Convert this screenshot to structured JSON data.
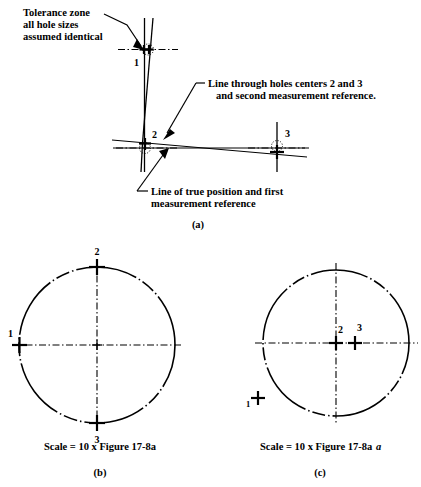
{
  "figure": {
    "title_letters": {
      "a": "(a)",
      "b": "(b)",
      "c": "(c)"
    },
    "panel_a": {
      "annotations": [
        {
          "name": "tolerance-zone-note",
          "lines": [
            "Tolerance zone",
            "all hole sizes",
            "assumed identical"
          ]
        },
        {
          "name": "line-through-holes-note",
          "lines": [
            "Line through holes centers 2 and 3",
            "and second measurement reference."
          ]
        },
        {
          "name": "true-position-note",
          "lines": [
            "Line of true position and first",
            "measurement  reference"
          ]
        }
      ],
      "hole_labels": [
        "1",
        "2",
        "3"
      ]
    },
    "panel_b": {
      "caption": "Scale = 10 x Figure 17-8a",
      "hole_labels": [
        "1",
        "2",
        "3"
      ]
    },
    "panel_c": {
      "caption_main": "Scale = 10 x Figure 17-8a",
      "caption_italic": "a",
      "hole_labels": [
        "1",
        "2",
        "3"
      ]
    }
  },
  "colors": {
    "ink": "#000000",
    "paper": "#ffffff"
  }
}
